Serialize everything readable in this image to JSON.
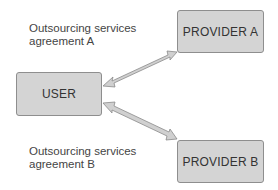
{
  "diagram": {
    "nodes": {
      "provider_a": "PROVIDER A",
      "user": "USER",
      "provider_b": "PROVIDER B"
    },
    "labels": {
      "agreement_a_line1": "Outsourcing services",
      "agreement_a_line2": "agreement A",
      "agreement_b_line1": "Outsourcing services",
      "agreement_b_line2": "agreement B"
    },
    "edges": [
      {
        "from": "user",
        "to": "provider_a",
        "type": "bidirectional"
      },
      {
        "from": "user",
        "to": "provider_b",
        "type": "bidirectional"
      }
    ],
    "colors": {
      "box_fill": "#d4d4d4",
      "box_border": "#8e8e8e",
      "arrow_fill": "#d0d0d0",
      "arrow_stroke": "#8a8a8a"
    }
  }
}
